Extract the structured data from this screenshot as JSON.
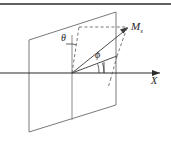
{
  "figure": {
    "kind": "geometry-diagram",
    "background_color": "#ffffff",
    "stroke_color": "#3a3a3a",
    "dashed_color": "#555555",
    "axis_color": "#2b2b2b"
  },
  "labels": {
    "theta": "θ",
    "phi": "ϕ",
    "point_m": "M",
    "point_m_subscript": "s",
    "axis_x": "X"
  },
  "geometry": {
    "plane_corners": [
      [
        29,
        40
      ],
      [
        116,
        12
      ],
      [
        116,
        105
      ],
      [
        29,
        132
      ]
    ],
    "origin": [
      72,
      73
    ],
    "point_m": [
      128,
      27
    ],
    "axis_start": [
      0,
      73
    ],
    "axis_end": [
      163,
      73
    ],
    "vertical_line_top": [
      72,
      35
    ],
    "vertical_line_bottom": [
      72,
      120
    ],
    "projection_point": [
      117,
      55
    ],
    "dashed_top_left": [
      79,
      27
    ],
    "arrow_head_size": 5
  },
  "frame": {
    "top_rule_y": 4,
    "top_rule_color": "#2b2b2b"
  }
}
